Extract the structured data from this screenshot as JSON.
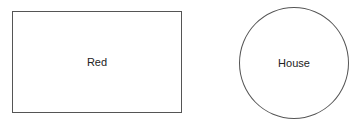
{
  "shapes": [
    {
      "type": "rectangle",
      "label": "Red"
    },
    {
      "type": "circle",
      "label": "House"
    }
  ]
}
